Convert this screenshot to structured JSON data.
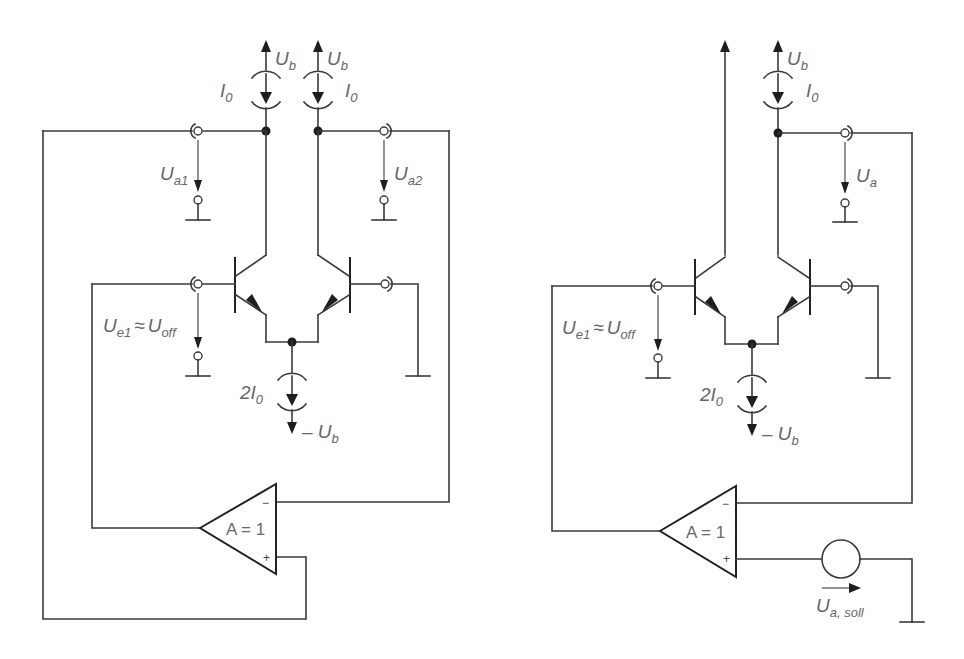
{
  "figure": {
    "left_circuit": {
      "supply_top_left": "U",
      "supply_top_left_sub": "b",
      "supply_top_right": "U",
      "supply_top_right_sub": "b",
      "current_left": "I",
      "current_left_sub": "0",
      "current_right": "I",
      "current_right_sub": "0",
      "output1": "U",
      "output1_sub": "a1",
      "output2": "U",
      "output2_sub": "a2",
      "input_voltage": "U",
      "input_voltage_sub": "e1",
      "approx": "≈",
      "offset": "U",
      "offset_sub": "off",
      "tail_current": "2I",
      "tail_current_sub": "0",
      "neg_supply": "– U",
      "neg_supply_sub": "b",
      "amp_gain": "A = 1",
      "amp_minus": "−",
      "amp_plus": "+"
    },
    "right_circuit": {
      "supply_top": "U",
      "supply_top_sub": "b",
      "current": "I",
      "current_sub": "0",
      "output": "U",
      "output_sub": "a",
      "input_voltage": "U",
      "input_voltage_sub": "e1",
      "approx": "≈",
      "offset": "U",
      "offset_sub": "off",
      "tail_current": "2I",
      "tail_current_sub": "0",
      "neg_supply": "– U",
      "neg_supply_sub": "b",
      "amp_gain": "A = 1",
      "amp_minus": "−",
      "amp_plus": "+",
      "setpoint": "U",
      "setpoint_sub": "a, soll"
    },
    "colors": {
      "wire": "#3a3a3a",
      "label": "#666666",
      "background": "#ffffff"
    }
  }
}
